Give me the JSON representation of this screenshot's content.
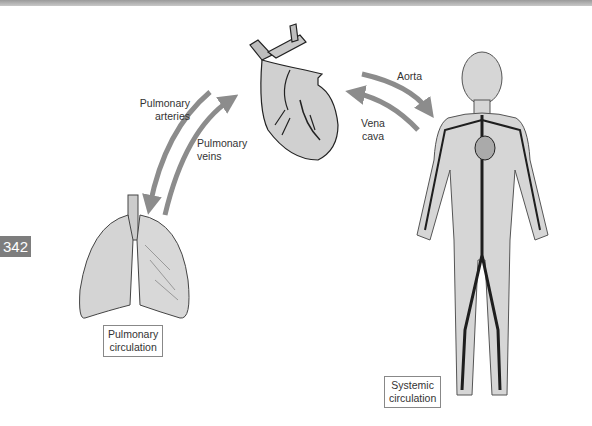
{
  "page_number": "342",
  "labels": {
    "pulmonary_arteries": [
      "Pulmonary",
      "arteries"
    ],
    "pulmonary_veins": [
      "Pulmonary",
      "veins"
    ],
    "aorta": "Aorta",
    "vena_cava": [
      "Vena",
      "cava"
    ],
    "pulmonary_circulation": [
      "Pulmonary",
      "circulation"
    ],
    "systemic_circulation": [
      "Systemic",
      "circulation"
    ]
  },
  "colors": {
    "arrow": "#8c8c8c",
    "organ_fill": "#d4d4d4",
    "vessel": "#1e1e1e",
    "page_badge": "#7d7d7d"
  }
}
